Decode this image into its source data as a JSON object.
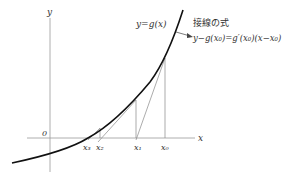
{
  "diagram": {
    "axes": {
      "x_label": "x",
      "y_label": "y",
      "origin_label": "0"
    },
    "curve_label": "y=g(x)",
    "tangent_title": "接線の式",
    "tangent_equation": "y−g(x₀)=g′(x₀)(x−x₀)",
    "x_points": [
      {
        "label": "x₃",
        "x": 90
      },
      {
        "label": "x₂",
        "x": 101
      },
      {
        "label": "x₁",
        "x": 137
      },
      {
        "label": "x₀",
        "x": 165
      }
    ],
    "colors": {
      "curve": "#111111",
      "axis": "#888888",
      "line": "#777777"
    }
  }
}
